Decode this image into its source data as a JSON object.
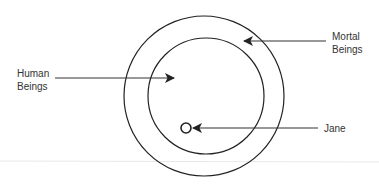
{
  "diagram": {
    "type": "euler-diagram",
    "colors": {
      "stroke": "#222222",
      "text": "#333333",
      "rule": "#e6e6e6"
    },
    "sets": [
      {
        "name": "Mortal Beings",
        "role": "outer-circle"
      },
      {
        "name": "Human Beings",
        "role": "inner-circle"
      },
      {
        "name": "Jane",
        "role": "element-point"
      }
    ],
    "labels": {
      "human": {
        "line1": "Human",
        "line2": "Beings"
      },
      "mortal": {
        "line1": "Mortal",
        "line2": "Beings"
      },
      "jane": {
        "line1": "Jane"
      }
    }
  }
}
